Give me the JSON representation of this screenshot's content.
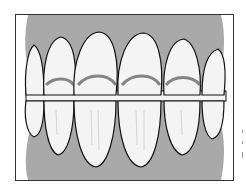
{
  "image": {
    "subject": "dental illustration of front teeth in occlusion",
    "colors": {
      "gum": "#a9a9a9",
      "tooth": "#f4f4f4",
      "outline": "#111111",
      "shade": "#555555",
      "background": "#ffffff"
    },
    "upper_teeth_count": 6,
    "lower_teeth_count": 6
  }
}
